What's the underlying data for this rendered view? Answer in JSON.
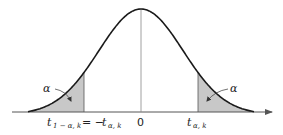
{
  "diagram": {
    "type": "t-distribution-two-tailed-critical-region",
    "colors": {
      "curve": "#1a1a1a",
      "shade": "#c8c8c8",
      "axis": "#555555",
      "centerline": "#888888"
    },
    "left_tail": {
      "area_label": "α",
      "critical_label_main": "t",
      "critical_label_sub": "1 − α, k",
      "equals_text": "= −",
      "neg_label_main": "t",
      "neg_label_sub": "α, k"
    },
    "center_label": "0",
    "right_tail": {
      "area_label": "α",
      "critical_label_main": "t",
      "critical_label_sub": "α, k"
    }
  }
}
